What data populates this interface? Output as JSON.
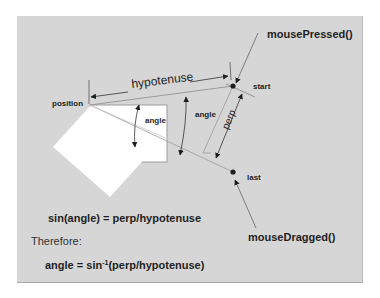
{
  "diagram": {
    "labels": {
      "mouse_pressed": "mousePressed()",
      "mouse_dragged": "mouseDragged()",
      "hypotenuse": "hypotenuse",
      "position": "position",
      "start": "start",
      "last": "last",
      "angle_inner": "angle",
      "angle_outer": "angle",
      "perp": "perp"
    },
    "formulas": {
      "line1": "sin(angle) = perp/hypotenuse",
      "line2": "Therefore:",
      "line3_prefix": "angle = sin",
      "line3_superscript": "-1",
      "line3_suffix": "(perp/hypotenuse)"
    },
    "colors": {
      "panel_bg": "#d6d6d6",
      "square_fill": "#ffffff",
      "line": "#666666",
      "arrow": "#1e1e1e",
      "text": "#1e1e1e"
    }
  }
}
